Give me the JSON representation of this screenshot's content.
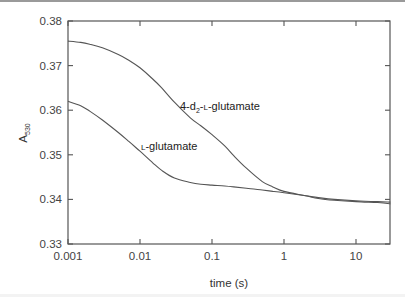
{
  "chart_data": {
    "type": "line",
    "title": "",
    "xlabel": "time (s)",
    "ylabel": "A530",
    "ylabel_main": "A",
    "ylabel_sub": "530",
    "xscale": "log",
    "xlim": [
      0.001,
      30
    ],
    "ylim": [
      0.33,
      0.38
    ],
    "xticks": [
      0.001,
      0.01,
      0.1,
      1,
      10
    ],
    "xtick_labels": [
      "0.001",
      "0.01",
      "0.1",
      "1",
      "10"
    ],
    "yticks": [
      0.33,
      0.34,
      0.35,
      0.36,
      0.37,
      0.38
    ],
    "ytick_labels": [
      "0.33",
      "0.34",
      "0.35",
      "0.36",
      "0.37",
      "0.38"
    ],
    "grid": false,
    "legend": "none (inline curve labels)",
    "series": [
      {
        "name": "4-d2-L-glutamate",
        "label_parts": {
          "pre": "4-d",
          "sub": "2",
          "mid": "-",
          "sc": "L",
          "post": "-glutamate"
        },
        "x": [
          0.001,
          0.0015,
          0.002,
          0.003,
          0.005,
          0.007,
          0.01,
          0.015,
          0.02,
          0.03,
          0.05,
          0.07,
          0.1,
          0.15,
          0.2,
          0.3,
          0.5,
          0.7,
          1,
          2,
          3,
          5,
          10,
          20,
          30
        ],
        "y": [
          0.3755,
          0.3752,
          0.3748,
          0.374,
          0.3725,
          0.3712,
          0.3695,
          0.367,
          0.365,
          0.3618,
          0.3583,
          0.3565,
          0.3545,
          0.352,
          0.3498,
          0.347,
          0.344,
          0.3428,
          0.3418,
          0.3408,
          0.3402,
          0.3398,
          0.3395,
          0.3393,
          0.339
        ]
      },
      {
        "name": "L-glutamate",
        "label_parts": {
          "pre": "",
          "sub": "",
          "mid": "",
          "sc": "L",
          "post": "-glutamate"
        },
        "x": [
          0.001,
          0.0015,
          0.002,
          0.003,
          0.005,
          0.007,
          0.01,
          0.015,
          0.02,
          0.03,
          0.05,
          0.07,
          0.1,
          0.15,
          0.2,
          0.3,
          0.5,
          0.7,
          1,
          2,
          3,
          5,
          10,
          20,
          30
        ],
        "y": [
          0.362,
          0.361,
          0.3598,
          0.3578,
          0.355,
          0.353,
          0.3508,
          0.3482,
          0.3465,
          0.3448,
          0.3438,
          0.3434,
          0.3432,
          0.343,
          0.3428,
          0.3425,
          0.3421,
          0.3418,
          0.3415,
          0.3408,
          0.3404,
          0.34,
          0.3397,
          0.3395,
          0.3394
        ]
      }
    ],
    "annotations": [
      {
        "text": "4-d2-L-glutamate",
        "x_px": 180,
        "y_px": 110
      },
      {
        "text": "L-glutamate",
        "x_px": 141,
        "y_px": 150
      }
    ],
    "colors": {
      "curves": "#555555",
      "frame": "#555555",
      "text": "#333333"
    }
  }
}
